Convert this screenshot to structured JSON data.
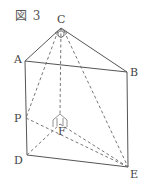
{
  "figure": {
    "caption": "図 3",
    "labels": {
      "A": "A",
      "B": "B",
      "C": "C",
      "D": "D",
      "E": "E",
      "F": "F",
      "P": "P"
    },
    "line_color": "#555555"
  }
}
